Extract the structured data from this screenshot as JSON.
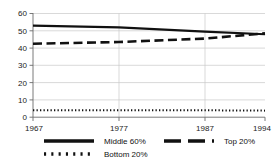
{
  "chart_data": {
    "type": "line",
    "title": "",
    "xlabel": "",
    "ylabel": "",
    "x": [
      1967,
      1977,
      1987,
      1994
    ],
    "xlim": [
      1967,
      1994
    ],
    "ylim": [
      0,
      60
    ],
    "yticks": [
      0,
      10,
      20,
      30,
      40,
      50,
      60
    ],
    "xticks": [
      1967,
      1977,
      1987,
      1994
    ],
    "grid": true,
    "legend_position": "bottom",
    "series": [
      {
        "name": "Middle 60%",
        "style": "solid",
        "values": [
          53.0,
          52.0,
          49.5,
          48.0
        ]
      },
      {
        "name": "Top 20%",
        "style": "dashed",
        "values": [
          42.5,
          43.5,
          45.5,
          48.5
        ]
      },
      {
        "name": "Bottom 20%",
        "style": "dotted",
        "values": [
          4.0,
          4.0,
          4.0,
          3.8
        ]
      }
    ]
  },
  "axes": {
    "y_tick_labels": [
      "60",
      "50",
      "40",
      "30",
      "20",
      "10",
      "0"
    ],
    "x_tick_labels": [
      "1967",
      "1977",
      "1987",
      "1994"
    ]
  },
  "legend": {
    "items": [
      {
        "label": "Middle 60%",
        "style": "solid"
      },
      {
        "label": "Top 20%",
        "style": "dashed"
      },
      {
        "label": "Bottom 20%",
        "style": "dotted"
      }
    ]
  },
  "colors": {
    "series_line": "#111111",
    "grid": "#c9c9c9",
    "axis": "#6b6b6b",
    "text": "#1a1a1a",
    "background": "#ffffff"
  }
}
